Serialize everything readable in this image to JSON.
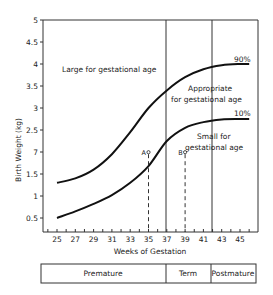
{
  "chart_data": {
    "type": "line",
    "title": "",
    "xlabel": "Weeks of Gestation",
    "ylabel": "Birth Weight (kg)",
    "xlim": [
      23.5,
      47
    ],
    "ylim": [
      0,
      5
    ],
    "x_ticks": [
      "25",
      "27",
      "29",
      "31",
      "33",
      "35",
      "37",
      "39",
      "41",
      "43",
      "45"
    ],
    "y_ticks": [
      {
        "value": 5,
        "label": "5"
      },
      {
        "value": 4.5,
        "label": "4.5"
      },
      {
        "value": 4,
        "label": "4"
      },
      {
        "value": 3.5,
        "label": "3.5"
      },
      {
        "value": 3,
        "label": "3"
      },
      {
        "value": 2.5,
        "label": "2.5"
      },
      {
        "value": 2,
        "label": "7"
      },
      {
        "value": 1.5,
        "label": "1.5"
      },
      {
        "value": 1,
        "label": "1"
      },
      {
        "value": 0.5,
        "label": "0.5"
      }
    ],
    "grid": false,
    "series": [
      {
        "name": "90%",
        "x": [
          25,
          27,
          29,
          31,
          33,
          35,
          37,
          39,
          41,
          43,
          45,
          46
        ],
        "values": [
          1.3,
          1.4,
          1.6,
          1.95,
          2.45,
          3.0,
          3.4,
          3.7,
          3.88,
          3.97,
          4.0,
          4.0
        ]
      },
      {
        "name": "10%",
        "x": [
          25,
          27,
          29,
          31,
          33,
          35,
          37,
          39,
          41,
          43,
          45,
          46
        ],
        "values": [
          0.5,
          0.65,
          0.82,
          1.02,
          1.3,
          1.68,
          2.25,
          2.55,
          2.68,
          2.74,
          2.75,
          2.75
        ]
      }
    ],
    "vertical_lines": [
      {
        "x": 37,
        "style": "solid"
      },
      {
        "x": 42,
        "style": "solid"
      }
    ],
    "markers": [
      {
        "label": "A",
        "x": 35,
        "y": 1.95,
        "dropline": "dashed"
      },
      {
        "label": "B",
        "x": 39,
        "y": 1.95,
        "dropline": "dashed"
      }
    ],
    "annotations": [
      "Large for gestational age",
      "Appropriate for gestational age",
      "Small for gestational age",
      "90%",
      "10%"
    ],
    "period_bands": [
      {
        "label": "Premature",
        "from": 23.5,
        "to": 37
      },
      {
        "label": "Term",
        "from": 37,
        "to": 42
      },
      {
        "label": "Postmature",
        "from": 42,
        "to": 47
      }
    ]
  },
  "labels": {
    "ylabel": "Birth Weight (kg)",
    "xlabel": "Weeks of Gestation",
    "large": "Large for gestational age",
    "appropriate_1": "Appropriate",
    "appropriate_2": "for gestational age",
    "small_1": "Small for",
    "small_2": "gestational age",
    "p90": "90%",
    "p10": "10%",
    "marker_a": "A",
    "marker_b": "B",
    "band_premature": "Premature",
    "band_term": "Term",
    "band_postmature": "Postmature"
  },
  "colors": {
    "ink": "#1a1a1a",
    "background": "#ffffff"
  }
}
